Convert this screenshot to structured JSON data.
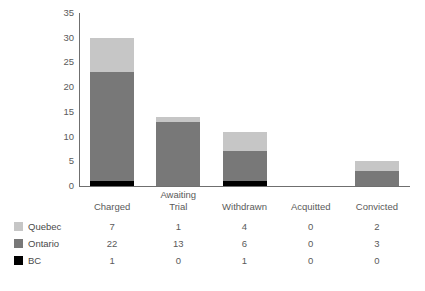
{
  "chart_data": {
    "type": "bar",
    "subtype": "stacked-column",
    "title": "",
    "xlabel": "",
    "ylabel": "",
    "ylim": [
      0,
      35
    ],
    "yticks": [
      0,
      5,
      10,
      15,
      20,
      25,
      30,
      35
    ],
    "grid": false,
    "legend_position": "bottom-left-table",
    "categories": [
      "Charged",
      "Awaiting Trial",
      "Withdrawn",
      "Acquitted",
      "Convicted"
    ],
    "category_lines": [
      [
        "",
        "Charged"
      ],
      [
        "Awaiting",
        "Trial"
      ],
      [
        "",
        "Withdrawn"
      ],
      [
        "",
        "Acquitted"
      ],
      [
        "",
        "Convicted"
      ]
    ],
    "series": [
      {
        "name": "Quebec",
        "color": "#c6c6c6",
        "values": [
          7,
          1,
          4,
          0,
          2
        ]
      },
      {
        "name": "Ontario",
        "color": "#787878",
        "values": [
          22,
          13,
          6,
          0,
          3
        ]
      },
      {
        "name": "BC",
        "color": "#000000",
        "values": [
          1,
          0,
          1,
          0,
          0
        ]
      }
    ],
    "stack_order_bottom_to_top": [
      "BC",
      "Ontario",
      "Quebec"
    ],
    "totals": [
      30,
      14,
      11,
      0,
      5
    ]
  },
  "axis": {
    "y_tick_labels": [
      "35",
      "30",
      "25",
      "20",
      "15",
      "10",
      "5",
      "0"
    ]
  },
  "table": {
    "row_labels": [
      "Quebec",
      "Ontario",
      "BC"
    ],
    "rows": [
      [
        "7",
        "1",
        "4",
        "0",
        "2"
      ],
      [
        "22",
        "13",
        "6",
        "0",
        "3"
      ],
      [
        "1",
        "0",
        "1",
        "0",
        "0"
      ]
    ]
  },
  "colors": {
    "quebec": "#c6c6c6",
    "ontario": "#787878",
    "bc": "#000000",
    "axis": "#6f6f6f",
    "text": "#5a5a5a",
    "background": "#ffffff"
  }
}
